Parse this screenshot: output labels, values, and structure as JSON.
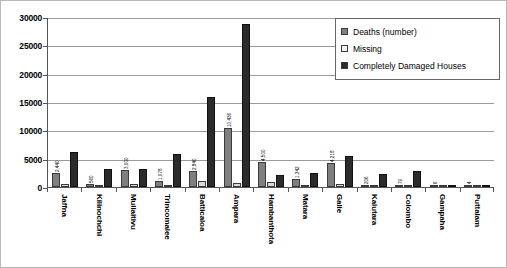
{
  "chart_data": {
    "type": "bar",
    "title": "",
    "xlabel": "",
    "ylabel": "",
    "ylim": [
      0,
      30000
    ],
    "ytick_labels": [
      "30000",
      "25000",
      "20000",
      "15000",
      "10000",
      "5000",
      "0"
    ],
    "ytick_values": [
      30000,
      25000,
      20000,
      15000,
      10000,
      5000,
      0
    ],
    "grid": true,
    "legend_position": "top-right",
    "categories": [
      "Jaffna",
      "Kilinochchi",
      "Mullaitivu",
      "Trincomalee",
      "Batticaloa",
      "Ampara",
      "Hambanthota",
      "Matara",
      "Galle",
      "Kalutara",
      "Colombo",
      "Gampaha",
      "Puttalam"
    ],
    "series": [
      {
        "name": "Deaths  (number)",
        "color": "#7f7f7f",
        "values": [
          2440,
          560,
          3000,
          1078,
          2840,
          10436,
          4500,
          1342,
          4218,
          206,
          79,
          6,
          4
        ],
        "labels": [
          "2,440",
          "560",
          "3,000",
          "1,078",
          "2,840",
          "10,436",
          "4,500",
          "1,342",
          "4,218",
          "206",
          "79",
          "6",
          "4"
        ]
      },
      {
        "name": "Missing",
        "color": "#d9d9d9",
        "values": [
          540,
          140,
          520,
          260,
          1100,
          780,
          920,
          440,
          480,
          60,
          20,
          0,
          0
        ],
        "labels": [
          "",
          "",
          "",
          "",
          "",
          "",
          "",
          "",
          "",
          "",
          "",
          "",
          ""
        ]
      },
      {
        "name": "Completely Damaged Houses",
        "color": "#2b2b2b",
        "values": [
          6100,
          3200,
          3200,
          5900,
          15900,
          28700,
          2050,
          2500,
          5400,
          2350,
          2800,
          300,
          120
        ],
        "labels": [
          "",
          "",
          "",
          "",
          "",
          "",
          "",
          "",
          "",
          "",
          "",
          "",
          ""
        ]
      }
    ]
  }
}
